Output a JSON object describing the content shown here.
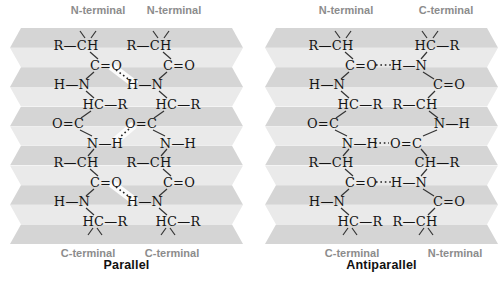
{
  "figure": {
    "background": "#ffffff",
    "pleat_dark": "#d5d5d5",
    "pleat_light": "#eaeaea",
    "label_gray": "#8c8c8c",
    "bond_color": "#333333",
    "hbond_color": "#222222",
    "hbond_highlight_color": "#fbfbfb",
    "band_count": 11,
    "panels": [
      {
        "id": "parallel",
        "title": "Parallel",
        "top_labels": [
          {
            "text": "N-terminal",
            "x": 88
          },
          {
            "text": "N-terminal",
            "x": 164
          }
        ],
        "bottom_labels": [
          {
            "text": "C-terminal",
            "x": 78
          },
          {
            "text": "C-terminal",
            "x": 162
          }
        ],
        "strands": [
          {
            "name": "left-strand",
            "groups": [
              {
                "t": "R—CH",
                "x": 66,
                "y": 17
              },
              {
                "t": "C=O",
                "x": 96,
                "y": 37
              },
              {
                "t": "H—N",
                "x": 62,
                "y": 56
              },
              {
                "t": "HC—R",
                "x": 95,
                "y": 76
              },
              {
                "t": "O=C",
                "x": 58,
                "y": 95
              },
              {
                "t": "N—H",
                "x": 95,
                "y": 115
              },
              {
                "t": "R—CH",
                "x": 66,
                "y": 134
              },
              {
                "t": "C=O",
                "x": 96,
                "y": 154
              },
              {
                "t": "H—N",
                "x": 62,
                "y": 173
              },
              {
                "t": "HC—R",
                "x": 95,
                "y": 193
              }
            ]
          },
          {
            "name": "right-strand",
            "groups": [
              {
                "t": "R—CH",
                "x": 139,
                "y": 17
              },
              {
                "t": "C=O",
                "x": 169,
                "y": 37
              },
              {
                "t": "H—N",
                "x": 135,
                "y": 56
              },
              {
                "t": "HC—R",
                "x": 168,
                "y": 76
              },
              {
                "t": "O=C",
                "x": 131,
                "y": 95
              },
              {
                "t": "N—H",
                "x": 168,
                "y": 115
              },
              {
                "t": "R—CH",
                "x": 139,
                "y": 134
              },
              {
                "t": "C=O",
                "x": 169,
                "y": 154
              },
              {
                "t": "H—N",
                "x": 135,
                "y": 173
              },
              {
                "t": "HC—R",
                "x": 168,
                "y": 193
              }
            ]
          }
        ],
        "bonds": [
          [
            70,
            3,
            75,
            10
          ],
          [
            86,
            3,
            81,
            10
          ],
          [
            80,
            24,
            88,
            31
          ],
          [
            84,
            44,
            76,
            51
          ],
          [
            76,
            63,
            84,
            70
          ],
          [
            81,
            83,
            71,
            90
          ],
          [
            70,
            102,
            82,
            108
          ],
          [
            84,
            121,
            78,
            128
          ],
          [
            80,
            141,
            88,
            148
          ],
          [
            84,
            161,
            76,
            168
          ],
          [
            76,
            180,
            84,
            187
          ],
          [
            83,
            200,
            78,
            207
          ],
          [
            87,
            200,
            92,
            207
          ],
          [
            143,
            3,
            148,
            10
          ],
          [
            159,
            3,
            154,
            10
          ],
          [
            153,
            24,
            161,
            31
          ],
          [
            157,
            44,
            149,
            51
          ],
          [
            149,
            63,
            157,
            70
          ],
          [
            154,
            83,
            144,
            90
          ],
          [
            143,
            102,
            155,
            108
          ],
          [
            157,
            121,
            151,
            128
          ],
          [
            153,
            141,
            161,
            148
          ],
          [
            157,
            161,
            149,
            168
          ],
          [
            149,
            180,
            157,
            187
          ],
          [
            156,
            200,
            151,
            207
          ],
          [
            160,
            200,
            165,
            207
          ]
        ],
        "hbonds": [
          [
            106,
            42,
            121,
            53
          ],
          [
            119,
            101,
            109,
            110
          ],
          [
            106,
            159,
            121,
            170
          ]
        ],
        "hbond_highlights": [
          [
            101,
            38,
            126,
            57
          ],
          [
            124,
            97,
            104,
            114
          ],
          [
            101,
            155,
            126,
            174
          ]
        ]
      },
      {
        "id": "antiparallel",
        "title": "Antiparallel",
        "top_labels": [
          {
            "text": "N-terminal",
            "x": 81
          },
          {
            "text": "C-terminal",
            "x": 181
          }
        ],
        "bottom_labels": [
          {
            "text": "C-terminal",
            "x": 87
          },
          {
            "text": "N-terminal",
            "x": 190
          }
        ],
        "strands": [
          {
            "name": "left-strand",
            "groups": [
              {
                "t": "R—CH",
                "x": 66,
                "y": 17
              },
              {
                "t": "C=O",
                "x": 96,
                "y": 37
              },
              {
                "t": "H—N",
                "x": 62,
                "y": 56
              },
              {
                "t": "HC—R",
                "x": 95,
                "y": 76
              },
              {
                "t": "O=C",
                "x": 58,
                "y": 95
              },
              {
                "t": "N—H",
                "x": 95,
                "y": 115
              },
              {
                "t": "R—CH",
                "x": 66,
                "y": 134
              },
              {
                "t": "C=O",
                "x": 96,
                "y": 154
              },
              {
                "t": "H—N",
                "x": 62,
                "y": 173
              },
              {
                "t": "HC—R",
                "x": 95,
                "y": 193
              }
            ]
          },
          {
            "name": "right-strand",
            "groups": [
              {
                "t": "HC—R",
                "x": 172,
                "y": 17
              },
              {
                "t": "H—N",
                "x": 144,
                "y": 37
              },
              {
                "t": "C=O",
                "x": 184,
                "y": 56
              },
              {
                "t": "R—CH",
                "x": 150,
                "y": 76
              },
              {
                "t": "N—H",
                "x": 187,
                "y": 95
              },
              {
                "t": "O=C",
                "x": 141,
                "y": 115
              },
              {
                "t": "CH—R",
                "x": 172,
                "y": 134
              },
              {
                "t": "H—N",
                "x": 144,
                "y": 154
              },
              {
                "t": "C=O",
                "x": 184,
                "y": 173
              },
              {
                "t": "R—CH",
                "x": 150,
                "y": 193
              }
            ]
          }
        ],
        "bonds": [
          [
            70,
            3,
            75,
            10
          ],
          [
            86,
            3,
            81,
            10
          ],
          [
            80,
            24,
            88,
            31
          ],
          [
            84,
            44,
            76,
            51
          ],
          [
            76,
            63,
            84,
            70
          ],
          [
            81,
            83,
            71,
            90
          ],
          [
            70,
            102,
            82,
            108
          ],
          [
            84,
            121,
            78,
            128
          ],
          [
            80,
            141,
            88,
            148
          ],
          [
            84,
            161,
            76,
            168
          ],
          [
            76,
            180,
            84,
            187
          ],
          [
            83,
            200,
            78,
            207
          ],
          [
            87,
            200,
            92,
            207
          ],
          [
            157,
            3,
            162,
            10
          ],
          [
            173,
            3,
            168,
            10
          ],
          [
            162,
            24,
            156,
            31
          ],
          [
            158,
            44,
            169,
            51
          ],
          [
            170,
            63,
            163,
            70
          ],
          [
            164,
            83,
            173,
            90
          ],
          [
            172,
            102,
            158,
            108
          ],
          [
            156,
            121,
            162,
            128
          ],
          [
            162,
            141,
            156,
            148
          ],
          [
            158,
            161,
            169,
            168
          ],
          [
            170,
            180,
            163,
            187
          ],
          [
            159,
            200,
            154,
            207
          ],
          [
            163,
            200,
            168,
            207
          ]
        ],
        "hbonds": [
          [
            111,
            37,
            127,
            37
          ],
          [
            110,
            115,
            124,
            115
          ],
          [
            111,
            154,
            127,
            154
          ]
        ],
        "hbond_highlights": []
      }
    ]
  }
}
